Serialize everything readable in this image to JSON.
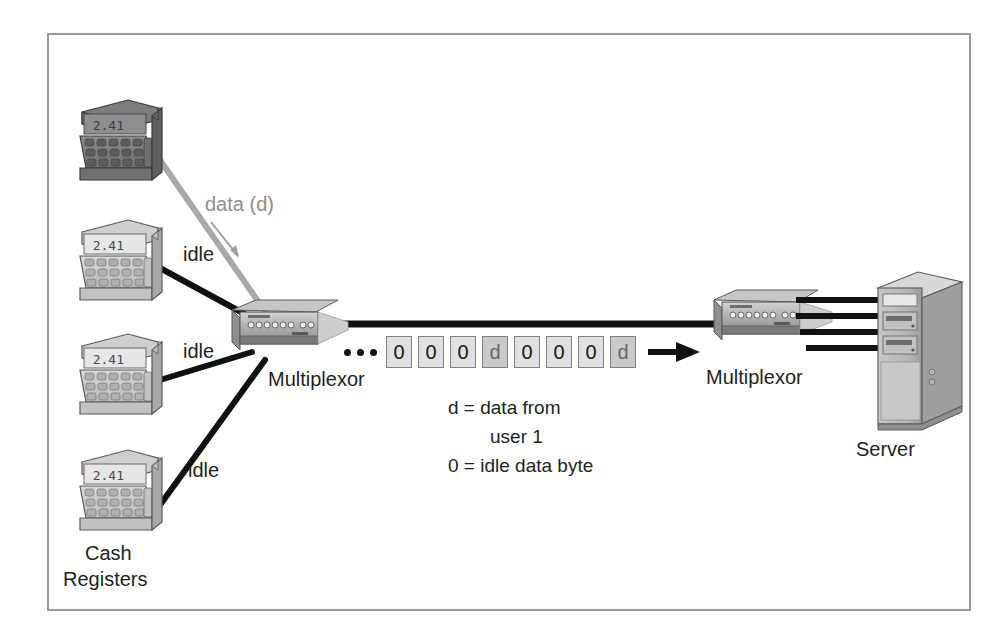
{
  "figure": {
    "border_color": "#9a9a9a",
    "background": "#ffffff"
  },
  "registers": {
    "group_label_line1": "Cash",
    "group_label_line2": "Registers",
    "display_value": "2.41",
    "items": [
      {
        "id": "register-1",
        "state": "active",
        "link_label": "data (d)",
        "link_color": "#a8a8a8"
      },
      {
        "id": "register-2",
        "state": "idle",
        "link_label": "idle",
        "link_color": "#000000"
      },
      {
        "id": "register-3",
        "state": "idle",
        "link_label": "idle",
        "link_color": "#000000"
      },
      {
        "id": "register-4",
        "state": "idle",
        "link_label": "idle",
        "link_color": "#000000"
      }
    ]
  },
  "multiplexors": {
    "left_label": "Multiplexor",
    "right_label": "Multiplexor"
  },
  "server": {
    "label": "Server",
    "link_count": 4
  },
  "stream": {
    "ellipsis_dots": 3,
    "bytes": [
      {
        "value": "0",
        "kind": "idle"
      },
      {
        "value": "0",
        "kind": "idle"
      },
      {
        "value": "0",
        "kind": "idle"
      },
      {
        "value": "d",
        "kind": "data"
      },
      {
        "value": "0",
        "kind": "idle"
      },
      {
        "value": "0",
        "kind": "idle"
      },
      {
        "value": "0",
        "kind": "idle"
      },
      {
        "value": "d",
        "kind": "data"
      }
    ]
  },
  "legend": {
    "line1": "d = data from",
    "line2": "user 1",
    "line3": "0 = idle data byte"
  },
  "chart_data": {
    "type": "diagram",
    "nodes": [
      "Cash Register 1 (active)",
      "Cash Register 2",
      "Cash Register 3",
      "Cash Register 4",
      "Multiplexor (left)",
      "Multiplexor (right)",
      "Server"
    ],
    "byte_sequence": [
      "0",
      "0",
      "0",
      "d",
      "0",
      "0",
      "0",
      "d"
    ],
    "legend": [
      "d = data from user 1",
      "0 = idle data byte"
    ]
  }
}
